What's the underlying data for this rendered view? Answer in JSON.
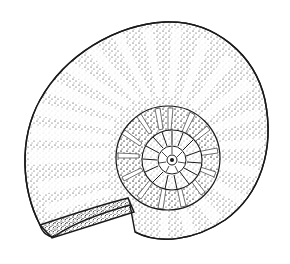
{
  "image": {
    "subject": "ammonite fossil",
    "style": "stippled ink illustration",
    "background_color": "#ffffff",
    "ink_color": "#1a1a1a",
    "width": 290,
    "height": 264
  }
}
